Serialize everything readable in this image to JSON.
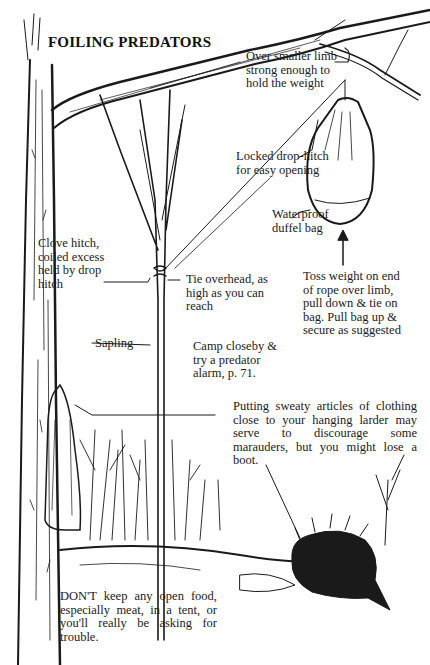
{
  "title": "FOILING PREDATORS",
  "labels": {
    "over_limb": "Over smaller limb\nstrong enough to\nhold the weight",
    "drop_hitch": "Locked drop-hitch\nfor easy opening",
    "duffel": "Waterproof\nduffel bag",
    "clove_hitch": "Clove hitch,\ncoiled excess\nheld by drop\nhitch",
    "tie_overhead": "Tie overhead, as\nhigh as you can\nreach",
    "toss_weight": "Toss weight on end\nof rope over limb,\npull down & tie on\nbag. Pull bag up &\nsecure as suggested",
    "sapling": "Sapling",
    "camp_closeby": "Camp closeby &\ntry a predator\nalarm, p. 71.",
    "sweaty_clothing": "Putting sweaty articles of clothing close to your hanging larder may serve to discourage some marauders, but you might lose a boot.",
    "dont_keep_food": "DON'T keep any open food, especially meat, in a tent, or you'll really be asking for trouble."
  },
  "illustration": {
    "elements": [
      "tree-trunk",
      "overhanging-limb",
      "sapling",
      "rope",
      "hanging-duffel-bag",
      "clothing-on-trunk",
      "background-trees",
      "porcupine",
      "upward-arrow"
    ],
    "ink_color": "#1a1a1a",
    "paper_color": "#ffffff"
  }
}
